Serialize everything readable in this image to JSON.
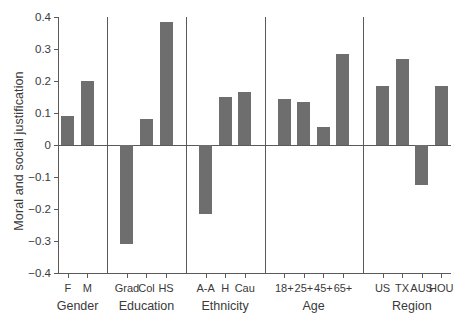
{
  "chart_data": {
    "type": "bar",
    "title": "",
    "subtitle": "",
    "xlabel": "",
    "ylabel": "Moral and social justification",
    "ylim": [
      -0.4,
      0.4
    ],
    "ytick_labels": [
      "0.4",
      "0.3",
      "0.2",
      "0.1",
      "0",
      "−0.1",
      "−0.2",
      "−0.3",
      "−0.4"
    ],
    "ytick_values": [
      0.4,
      0.3,
      0.2,
      0.1,
      0,
      -0.1,
      -0.2,
      -0.3,
      -0.4
    ],
    "grid": false,
    "legend": "none",
    "bar_color": "#6e6e6e",
    "axis_color": "#5a5a5a",
    "zero_line": 0,
    "categories": [
      "F",
      "M",
      "Grad",
      "Col",
      "HS",
      "A-A",
      "H",
      "Cau",
      "18+",
      "25+",
      "45+",
      "65+",
      "US",
      "TX",
      "AUS",
      "HOU"
    ],
    "values": [
      0.09,
      0.2,
      -0.31,
      0.08,
      0.385,
      -0.215,
      0.15,
      0.165,
      0.145,
      0.135,
      0.055,
      0.285,
      0.185,
      0.27,
      -0.125,
      0.185
    ],
    "groups": [
      {
        "name": "Gender",
        "categories": [
          "F",
          "M"
        ],
        "values": [
          0.09,
          0.2
        ]
      },
      {
        "name": "Education",
        "categories": [
          "Grad",
          "Col",
          "HS"
        ],
        "values": [
          -0.31,
          0.08,
          0.385
        ]
      },
      {
        "name": "Ethnicity",
        "categories": [
          "A-A",
          "H",
          "Cau"
        ],
        "values": [
          -0.215,
          0.15,
          0.165
        ]
      },
      {
        "name": "Age",
        "categories": [
          "18+",
          "25+",
          "45+",
          "65+"
        ],
        "values": [
          0.145,
          0.135,
          0.055,
          0.285
        ]
      },
      {
        "name": "Region",
        "categories": [
          "US",
          "TX",
          "AUS",
          "HOU"
        ],
        "values": [
          0.185,
          0.27,
          -0.125,
          0.185
        ]
      }
    ]
  }
}
